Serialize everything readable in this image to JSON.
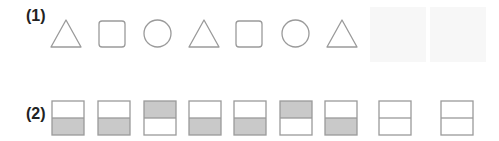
{
  "colors": {
    "stroke": "#9a9a9a",
    "shade": "#c9c9c9",
    "faint": "#f7f7f7"
  },
  "problems": [
    {
      "label": "(1)",
      "sequence": [
        "triangle",
        "square",
        "circle",
        "triangle",
        "square",
        "circle",
        "triangle"
      ],
      "blanks": 2
    },
    {
      "label": "(2)",
      "sequence": [
        "bottom-shaded",
        "bottom-shaded",
        "top-shaded",
        "bottom-shaded",
        "bottom-shaded",
        "top-shaded",
        "bottom-shaded"
      ],
      "blanks": 2
    }
  ]
}
